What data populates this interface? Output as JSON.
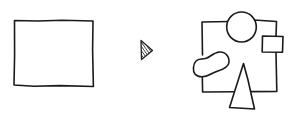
{
  "diagram": {
    "colors": {
      "stroke": "#1a1a1a",
      "background": "#ffffff",
      "arrow_fill": "#333333"
    },
    "left_shape": {
      "type": "rectangle",
      "x": 14,
      "y": 20,
      "width": 79,
      "height": 66
    },
    "arrow": {
      "type": "hatched-triangle",
      "direction": "right",
      "points": "141,41 152,50 141,59"
    },
    "right_shape": {
      "frame": {
        "type": "rectangle",
        "x": 202,
        "y": 21,
        "width": 75,
        "height": 71
      },
      "circle": {
        "cx": 241,
        "cy": 27,
        "r": 15
      },
      "small_rect": {
        "x": 262,
        "y": 36,
        "width": 21,
        "height": 16
      },
      "blob": {
        "type": "kidney-shape"
      },
      "triangle": {
        "points": "243,63 230,108 254,109"
      }
    }
  }
}
